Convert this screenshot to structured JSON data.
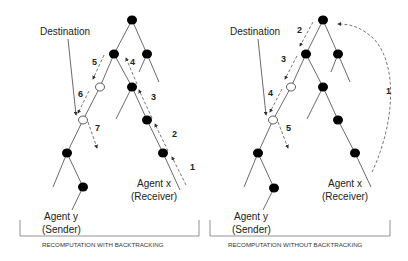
{
  "diagram": {
    "panels": [
      {
        "id": "left",
        "caption": "RECOMPUTATION WITH BACKTRACKING",
        "destination_label": "Destination",
        "receiver_label_1": "Agent x",
        "receiver_label_2": "(Receiver)",
        "sender_label_1": "Agent y",
        "sender_label_2": "(Sender)",
        "steps": [
          "1",
          "2",
          "3",
          "4",
          "5",
          "6",
          "7"
        ]
      },
      {
        "id": "right",
        "caption": "RECOMPUTATION WITHOUT BACKTRACKING",
        "destination_label": "Destination",
        "receiver_label_1": "Agent x",
        "receiver_label_2": "(Receiver)",
        "sender_label_1": "Agent y",
        "sender_label_2": "(Sender)",
        "steps": [
          "1",
          "2",
          "3",
          "4",
          "5"
        ]
      }
    ],
    "legend": {
      "filled_node": "tree node",
      "open_node": "path node toward destination",
      "dashed_arrow": "message step"
    }
  }
}
